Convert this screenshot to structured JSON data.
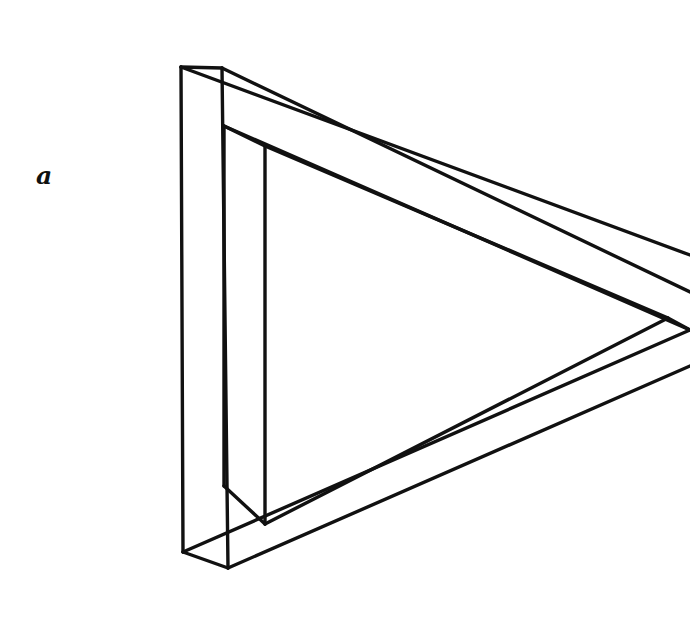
{
  "figure": {
    "label": "a",
    "label_position": {
      "x": 36,
      "y": 156
    },
    "background_color": "#ffffff",
    "stroke_color": "#111111",
    "fill_color": "#ffffff",
    "stroke_width": 3.4,
    "canvas": {
      "width": 690,
      "height": 642
    },
    "geometry": {
      "outer_front_triangle": [
        {
          "x": 222,
          "y": 68
        },
        {
          "x": 690,
          "y": 292
        },
        {
          "x": 228,
          "y": 568
        }
      ],
      "inner_front_triangle": [
        {
          "x": 265,
          "y": 146
        },
        {
          "x": 668,
          "y": 318
        },
        {
          "x": 265,
          "y": 524
        }
      ],
      "outer_back_triangle": [
        {
          "x": 181,
          "y": 67
        },
        {
          "x": 690,
          "y": 255
        },
        {
          "x": 183,
          "y": 552
        }
      ],
      "inner_back_triangle": [
        {
          "x": 224,
          "y": 126
        },
        {
          "x": 690,
          "y": 330
        },
        {
          "x": 224,
          "y": 486
        }
      ],
      "left_bar_vertical_lines": [
        {
          "x": 181,
          "y1": 67,
          "y2": 552
        },
        {
          "x": 224,
          "y1": 126,
          "y2": 486
        },
        {
          "x": 222,
          "y1": 68,
          "y2": 568
        },
        {
          "x": 265,
          "y1": 146,
          "y2": 524
        }
      ],
      "right_edge_exit_points": [
        {
          "x": 690,
          "y": 255
        },
        {
          "x": 690,
          "y": 292
        },
        {
          "x": 690,
          "y": 330
        },
        {
          "x": 690,
          "y": 366
        }
      ],
      "right_vertex": {
        "x": 668,
        "y": 318
      }
    }
  }
}
